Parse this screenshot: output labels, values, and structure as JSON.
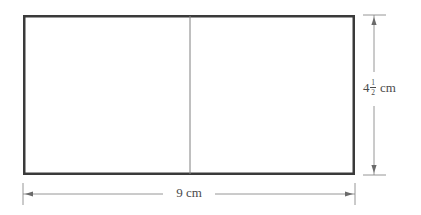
{
  "figure": {
    "type": "geometry-diagram",
    "shape": "rectangle",
    "background_color": "#ffffff",
    "outline_color": "#3a3a3a",
    "divider_color": "#808080",
    "dimension_color": "#6a6a6a",
    "label_color": "#4a4a4a"
  },
  "rectangle": {
    "left": 23,
    "top": 15,
    "right": 355,
    "bottom": 175,
    "border_width": 2.5,
    "divider_x": 190,
    "divider_width": 1
  },
  "dimensions": {
    "height": {
      "whole": "4",
      "numerator": "1",
      "denominator": "2",
      "unit": "cm",
      "full_text": "4 1/2 cm",
      "line_x": 374,
      "from_y": 15,
      "to_y": 175
    },
    "width": {
      "value": "9",
      "unit": "cm",
      "full_text": "9 cm",
      "line_y": 194,
      "from_x": 23,
      "to_x": 355
    }
  }
}
